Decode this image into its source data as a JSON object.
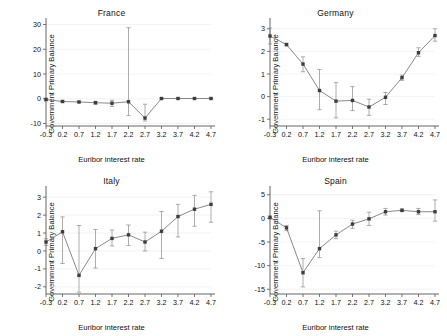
{
  "figure": {
    "width": 447,
    "height": 336,
    "background": "#ffffff",
    "line_color": "#6b6b6b",
    "marker_color": "#3d3d3d",
    "error_color": "#8a8a8a",
    "grid_color": "#eeeeee",
    "axis_color": "#555555"
  },
  "common": {
    "xlabel": "Euribor interest rate",
    "ylabel": "Government Primary Balance",
    "xticks": [
      "-0.3",
      "0.2",
      "0.7",
      "1.2",
      "1.7",
      "2.2",
      "2.7",
      "3.2",
      "3.7",
      "4.2",
      "4.7"
    ]
  },
  "chart_data": [
    {
      "type": "line",
      "title": "France",
      "xlabel": "Euribor interest rate",
      "ylabel": "Government Primary Balance",
      "x": [
        -0.3,
        0.2,
        0.7,
        1.2,
        1.7,
        2.2,
        2.7,
        3.2,
        3.7,
        4.2,
        4.7
      ],
      "categories": [
        "-0.3",
        "0.2",
        "0.7",
        "1.2",
        "1.7",
        "2.2",
        "2.7",
        "3.2",
        "3.7",
        "4.2",
        "4.7"
      ],
      "values": [
        -0.3,
        -1.1,
        -1.3,
        -1.6,
        -1.8,
        -1.2,
        -7.8,
        0.1,
        0.1,
        0.1,
        0.1
      ],
      "err_low": [
        -0.8,
        -1.4,
        -1.6,
        -2.2,
        -3.1,
        -6.8,
        -9.0,
        0.0,
        0.0,
        0.0,
        0.0
      ],
      "err_high": [
        0.2,
        -0.8,
        -1.0,
        -1.0,
        -0.6,
        28.7,
        -2.2,
        0.3,
        0.3,
        0.3,
        0.3
      ],
      "yticks": [
        -10,
        0,
        10,
        20,
        30
      ],
      "ytick_labels": [
        "-10",
        "0",
        "10",
        "20",
        "30"
      ],
      "ylim": [
        -11,
        31
      ],
      "grid": true,
      "legend": "none"
    },
    {
      "type": "line",
      "title": "Germany",
      "xlabel": "Euribor interest rate",
      "ylabel": "Government Primary Balance",
      "x": [
        -0.3,
        0.2,
        0.7,
        1.2,
        1.7,
        2.2,
        2.7,
        3.2,
        3.7,
        4.2,
        4.7
      ],
      "categories": [
        "-0.3",
        "0.2",
        "0.7",
        "1.2",
        "1.7",
        "2.2",
        "2.7",
        "3.2",
        "3.7",
        "4.2",
        "4.7"
      ],
      "values": [
        2.68,
        2.3,
        1.44,
        0.27,
        -0.2,
        -0.17,
        -0.46,
        -0.03,
        0.84,
        1.94,
        2.7
      ],
      "err_low": [
        2.33,
        2.25,
        1.1,
        -0.58,
        -0.94,
        -0.62,
        -0.83,
        -0.35,
        0.72,
        1.78,
        2.45
      ],
      "err_high": [
        3.03,
        2.36,
        1.76,
        1.2,
        0.62,
        0.44,
        -0.11,
        0.18,
        0.95,
        2.16,
        3.0
      ],
      "yticks": [
        -1,
        0,
        1,
        2,
        3
      ],
      "ytick_labels": [
        "-1",
        "0",
        "1",
        "2",
        "3"
      ],
      "ylim": [
        -1.3,
        3.3
      ],
      "grid": true,
      "legend": "none"
    },
    {
      "type": "line",
      "title": "Italy",
      "xlabel": "Euribor interest rate",
      "ylabel": "Government Primary Balance",
      "x": [
        -0.3,
        0.2,
        0.7,
        1.2,
        1.7,
        2.2,
        2.7,
        3.2,
        3.7,
        4.2,
        4.7
      ],
      "categories": [
        "-0.3",
        "0.2",
        "0.7",
        "1.2",
        "1.7",
        "2.2",
        "2.7",
        "3.2",
        "3.7",
        "4.2",
        "4.7"
      ],
      "values": [
        0.5,
        1.07,
        -1.36,
        0.13,
        0.7,
        0.9,
        0.5,
        1.1,
        1.92,
        2.33,
        2.6
      ],
      "err_low": [
        0.31,
        -0.7,
        -2.3,
        -0.95,
        0.28,
        0.3,
        0.0,
        -0.42,
        0.78,
        1.38,
        1.6
      ],
      "err_high": [
        0.68,
        1.9,
        1.42,
        1.2,
        1.17,
        1.45,
        1.05,
        2.2,
        2.6,
        3.1,
        3.3
      ],
      "yticks": [
        -2,
        -1,
        0,
        1,
        2,
        3
      ],
      "ytick_labels": [
        "-2",
        "-1",
        "0",
        "1",
        "2",
        "3"
      ],
      "ylim": [
        -2.4,
        3.4
      ],
      "grid": true,
      "legend": "none"
    },
    {
      "type": "line",
      "title": "Spain",
      "xlabel": "Euribor interest rate",
      "ylabel": "Government Primary Balance",
      "x": [
        -0.3,
        0.2,
        0.7,
        1.2,
        1.7,
        2.2,
        2.7,
        3.2,
        3.7,
        4.2,
        4.7
      ],
      "categories": [
        "-0.3",
        "0.2",
        "0.7",
        "1.2",
        "1.7",
        "2.2",
        "2.7",
        "3.2",
        "3.7",
        "4.2",
        "4.7"
      ],
      "values": [
        0.2,
        -2.0,
        -11.5,
        -6.4,
        -3.5,
        -1.2,
        -0.1,
        1.4,
        1.7,
        1.4,
        1.4
      ],
      "err_low": [
        -0.1,
        -2.6,
        -14.5,
        -8.3,
        -4.3,
        -2.1,
        -1.5,
        0.7,
        1.4,
        0.8,
        -0.6
      ],
      "err_high": [
        0.5,
        -1.5,
        -8.5,
        1.6,
        -2.7,
        -0.4,
        1.3,
        2.1,
        2.0,
        2.1,
        3.9
      ],
      "yticks": [
        -15,
        -10,
        -5,
        0,
        5
      ],
      "ytick_labels": [
        "-15",
        "-10",
        "-5",
        "0",
        "5"
      ],
      "ylim": [
        -16,
        6
      ],
      "grid": true,
      "legend": "none"
    }
  ]
}
